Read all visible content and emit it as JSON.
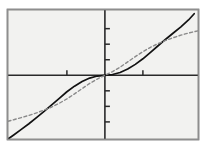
{
  "chart_data": {
    "type": "line",
    "title": "",
    "subtitle": "",
    "xlabel": "",
    "ylabel": "",
    "xlim": [
      -2.55,
      2.45
    ],
    "ylim": [
      -2.05,
      2.1
    ],
    "grid": false,
    "legend_position": "none",
    "axis_style": "centered-cartesian-with-frame",
    "background_color": "#f2f2f0",
    "frame_color": "#8e8e8e",
    "axis_color": "#2a2a2a",
    "x_axis_value": 0,
    "y_axis_value": 0,
    "x_ticks": [
      -1,
      1
    ],
    "x_tick_labels": [
      "",
      ""
    ],
    "y_ticks": [
      -1.5,
      -1.0,
      -0.5,
      0.5,
      1.0,
      1.5
    ],
    "y_tick_labels": [
      "",
      "",
      "",
      "",
      "",
      ""
    ],
    "tick_length_px": 5,
    "tick_direction": "inward",
    "series": [
      {
        "name": "solid-curve",
        "style": "solid",
        "color": "#121212",
        "width_px": 1.7,
        "function": "cube",
        "description": "odd cubic-like curve passing through origin, steep at the extremes",
        "x": [
          -2.55,
          -2.4,
          -2.2,
          -2.0,
          -1.8,
          -1.6,
          -1.4,
          -1.2,
          -1.0,
          -0.8,
          -0.6,
          -0.4,
          -0.2,
          0.0,
          0.2,
          0.4,
          0.6,
          0.8,
          1.0,
          1.2,
          1.4,
          1.6,
          1.8,
          2.0,
          2.2,
          2.35
        ],
        "y": [
          -2.05,
          -1.92,
          -1.74,
          -1.56,
          -1.36,
          -1.16,
          -0.95,
          -0.74,
          -0.53,
          -0.35,
          -0.2,
          -0.09,
          -0.025,
          0.0,
          0.025,
          0.09,
          0.2,
          0.35,
          0.53,
          0.74,
          0.95,
          1.16,
          1.36,
          1.56,
          1.78,
          1.98
        ]
      },
      {
        "name": "dashed-curve",
        "style": "dashed",
        "color": "#8a8a8a",
        "width_px": 1.4,
        "dash_pattern_px": "3,2.5",
        "function": "shallower-odd-curve",
        "description": "odd curve through origin, flatter than the solid curve, lies above it for x<0 and below it for x>0",
        "x": [
          -2.55,
          -2.4,
          -2.2,
          -2.0,
          -1.8,
          -1.6,
          -1.4,
          -1.2,
          -1.0,
          -0.8,
          -0.6,
          -0.4,
          -0.2,
          0.0,
          0.2,
          0.4,
          0.6,
          0.8,
          1.0,
          1.2,
          1.4,
          1.6,
          1.8,
          2.0,
          2.2,
          2.45
        ],
        "y": [
          -1.48,
          -1.43,
          -1.36,
          -1.29,
          -1.21,
          -1.12,
          -1.02,
          -0.9,
          -0.76,
          -0.6,
          -0.43,
          -0.26,
          -0.12,
          0.0,
          0.12,
          0.26,
          0.43,
          0.6,
          0.76,
          0.9,
          1.02,
          1.12,
          1.21,
          1.29,
          1.36,
          1.43
        ]
      }
    ],
    "annotations": []
  }
}
